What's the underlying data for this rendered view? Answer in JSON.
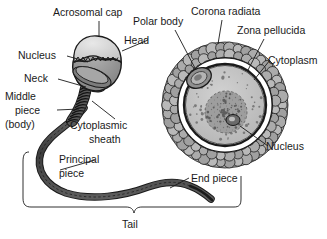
{
  "figure": {
    "background_color": "#ffffff",
    "ink_color": "#1a1a1a"
  },
  "labels": {
    "acrosomal_cap": "Acrosomal cap",
    "head": "Head",
    "nucleus_sperm": "Nucleus",
    "neck": "Neck",
    "middle_piece_line1": "Middle",
    "middle_piece_line2": "piece",
    "middle_piece_line3": "(body)",
    "cytoplasmic_sheath_line1": "Cytoplasmic",
    "cytoplasmic_sheath_line2": "sheath",
    "principal_piece_line1": "Principal",
    "principal_piece_line2": "piece",
    "end_piece": "End piece",
    "tail": "Tail",
    "polar_body": "Polar body",
    "corona_radiata": "Corona radiata",
    "zona_pellucida": "Zona pellucida",
    "cytoplasm": "Cytoplasm",
    "nucleus_ovum": "Nucleus"
  },
  "colors": {
    "outline": "#1a1a1a",
    "acrosome_fill": "#d8d8d8",
    "head_nucleus_fill": "#9a9a9a",
    "neck_fill": "#6e6e6e",
    "midpiece_fill": "#585858",
    "tail_fill": "#4a4a4a",
    "corona_fill": "#a8a8a8",
    "zona_fill": "#ffffff",
    "cytoplasm_fill": "#c4c4c4",
    "ovum_nucleus_fill": "#9e9e9e",
    "nucleolus_fill": "#6a6a6a",
    "polar_body_fill": "#8f8f8f"
  }
}
